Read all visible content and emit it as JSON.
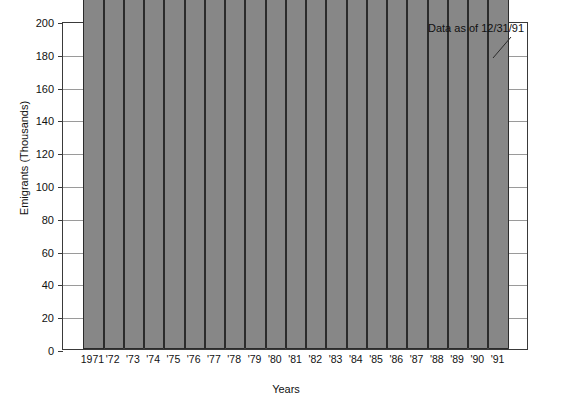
{
  "chart_data": {
    "type": "bar",
    "title": "",
    "xlabel": "Years",
    "ylabel": "Emigrants (Thousands)",
    "ylim": [
      0,
      200
    ],
    "yticks": [
      0,
      20,
      40,
      60,
      80,
      100,
      120,
      140,
      160,
      180,
      200
    ],
    "grid": true,
    "legend": null,
    "units": "persons",
    "categories": [
      "1971",
      "'72",
      "'73",
      "'74",
      "'75",
      "'76",
      "'77",
      "'78",
      "'79",
      "'80",
      "'81",
      "'82",
      "'83",
      "'84",
      "'85",
      "'86",
      "'87",
      "'88",
      "'89",
      "'90",
      "'91"
    ],
    "values": [
      13022,
      31681,
      34733,
      20628,
      13221,
      14261,
      16736,
      28864,
      51320,
      21471,
      9447,
      2688,
      1314,
      896,
      1140,
      914,
      8155,
      18965,
      71217,
      183500,
      178000
    ],
    "value_labels": [
      "13,022",
      "31,681",
      "34,733",
      "20,628",
      "13,221",
      "14,261",
      "16,736",
      "28,864",
      "51,320",
      "21,471",
      "9,447",
      "2,688",
      "1,314",
      "896",
      "1,140",
      "914",
      "8,155",
      "18,965",
      "71,217",
      "",
      ""
    ],
    "annotations": [
      {
        "text": "Data as of 12/31/91",
        "target_category": "'91"
      }
    ]
  },
  "style": {
    "bar_fill": "#878787",
    "bar_stroke": "#2b2b2b",
    "grid_color": "#9a9a9a",
    "frame_color": "#3a3a3a",
    "background": "#ffffff",
    "text_color": "#111111"
  }
}
